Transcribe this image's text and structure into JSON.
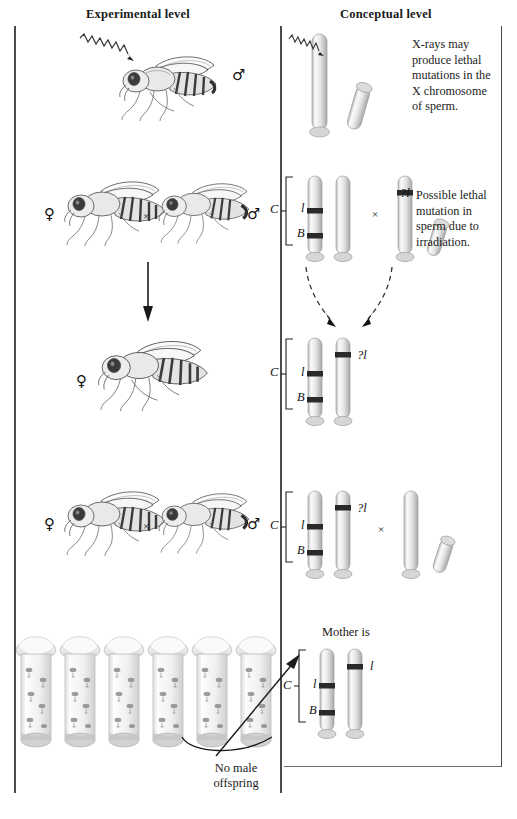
{
  "figure": {
    "columns": {
      "experimental": "Experimental level",
      "conceptual": "Conceptual level"
    }
  },
  "annotations": {
    "xray_note": "X-rays may produce lethal mutations in the X chromosome of sperm.",
    "lethal_note": "Possible lethal mutation in sperm due to irradiation.",
    "mother_is": "Mother is",
    "no_male_offspring": "No male offspring"
  },
  "symbols": {
    "female": "♀",
    "male": "♂",
    "cross": "×"
  },
  "chromosome_labels": {
    "c": "C",
    "l": "l",
    "b": "B",
    "query_l": "?l"
  },
  "rows": [
    {
      "id": "row-irradiation",
      "experimental": {
        "flies": [
          {
            "sex": "♂",
            "label_side": "right"
          }
        ],
        "xray": true
      },
      "conceptual": {
        "groups": [
          {
            "chromosomes": [
              {
                "type": "X",
                "bands": []
              },
              {
                "type": "Y",
                "bands": []
              }
            ],
            "brace": false
          }
        ],
        "note": "X-rays may produce lethal mutations in the X chromosome of sperm."
      }
    },
    {
      "id": "row-p-cross",
      "experimental": {
        "flies": [
          {
            "sex": "♀",
            "label_side": "left"
          },
          {
            "sex": "♂",
            "label_side": "right"
          }
        ],
        "cross": "×"
      },
      "conceptual": {
        "groups": [
          {
            "brace": true,
            "brace_label": "C",
            "chromosomes": [
              {
                "type": "X",
                "bands": [
                  {
                    "label": "l",
                    "pos": 46,
                    "side": "left"
                  },
                  {
                    "label": "B",
                    "pos": 78,
                    "side": "left"
                  }
                ]
              },
              {
                "type": "X",
                "bands": []
              }
            ]
          },
          {
            "brace": false,
            "cross": "×",
            "chromosomes": [
              {
                "type": "X",
                "bands": [
                  {
                    "label": "?l",
                    "pos": 22,
                    "side": "right"
                  }
                ]
              },
              {
                "type": "Y",
                "bands": []
              }
            ]
          }
        ],
        "note": "Possible lethal mutation in sperm due to irradiation."
      }
    },
    {
      "id": "row-f1-female",
      "experimental": {
        "arrow": "down",
        "flies": [
          {
            "sex": "♀",
            "label_side": "left"
          }
        ]
      },
      "conceptual": {
        "dashed_arrows": 2,
        "groups": [
          {
            "brace": true,
            "brace_label": "C",
            "chromosomes": [
              {
                "type": "X",
                "bands": [
                  {
                    "label": "l",
                    "pos": 46,
                    "side": "left"
                  },
                  {
                    "label": "B",
                    "pos": 78,
                    "side": "left"
                  }
                ]
              },
              {
                "type": "X",
                "bands": [
                  {
                    "label": "?l",
                    "pos": 22,
                    "side": "right"
                  }
                ]
              }
            ]
          }
        ]
      }
    },
    {
      "id": "row-f1-cross",
      "experimental": {
        "flies": [
          {
            "sex": "♀",
            "label_side": "left"
          },
          {
            "sex": "♂",
            "label_side": "right"
          }
        ],
        "cross": "×"
      },
      "conceptual": {
        "groups": [
          {
            "brace": true,
            "brace_label": "C",
            "chromosomes": [
              {
                "type": "X",
                "bands": [
                  {
                    "label": "l",
                    "pos": 46,
                    "side": "left"
                  },
                  {
                    "label": "B",
                    "pos": 78,
                    "side": "left"
                  }
                ]
              },
              {
                "type": "X",
                "bands": [
                  {
                    "label": "?l",
                    "pos": 22,
                    "side": "right"
                  }
                ]
              }
            ]
          },
          {
            "brace": false,
            "cross": "×",
            "chromosomes": [
              {
                "type": "X",
                "bands": []
              },
              {
                "type": "Y",
                "bands": []
              }
            ]
          }
        ]
      }
    },
    {
      "id": "row-result",
      "experimental": {
        "vials": 6,
        "callout": "No male offspring"
      },
      "conceptual": {
        "heading": "Mother is",
        "groups": [
          {
            "brace": true,
            "brace_label": "C",
            "chromosomes": [
              {
                "type": "X",
                "bands": [
                  {
                    "label": "l",
                    "pos": 46,
                    "side": "left"
                  },
                  {
                    "label": "B",
                    "pos": 78,
                    "side": "left"
                  }
                ]
              },
              {
                "type": "X",
                "bands": [
                  {
                    "label": "l",
                    "pos": 22,
                    "side": "right"
                  }
                ]
              }
            ]
          }
        ]
      }
    }
  ],
  "colors": {
    "rule": "#4a4a4a",
    "chromosome_light": "#f2f2f2",
    "chromosome_mid": "#c9c9c9",
    "chromosome_shadow": "#9a9a9a",
    "band": "#2a2a2a",
    "text": "#1a1a1a"
  }
}
